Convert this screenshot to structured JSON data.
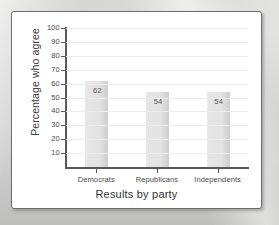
{
  "figure": {
    "panel_background": "#ffffff",
    "panel_border_color": "#6d6d6d",
    "corner_mark": "·"
  },
  "chart_data": {
    "type": "bar",
    "title": "",
    "subtitle": "",
    "categories": [
      "Democrats",
      "Republicans",
      "Independents"
    ],
    "values": [
      62,
      54,
      54
    ],
    "value_labels": [
      "62",
      "54",
      "54"
    ],
    "xlabel": "Results by party",
    "ylabel": "Percentage who agree",
    "ylim": [
      0,
      100
    ],
    "ytick_values": [
      100,
      90,
      80,
      70,
      60,
      50,
      40,
      30,
      20,
      10
    ],
    "ytick_labels": [
      "100",
      "90",
      "80",
      "70",
      "60",
      "50",
      "40",
      "30",
      "20",
      "10"
    ],
    "grid": true,
    "grid_orientation": "horizontal",
    "legend": false,
    "legend_position": "none",
    "bar_fill_color": "#e3e3e3",
    "bar_edge_color": "#cdcdcd",
    "axis_color": "#585858",
    "gridline_color": "#ececec"
  }
}
